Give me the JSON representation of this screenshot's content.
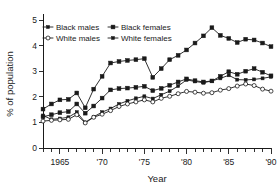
{
  "chart_data": {
    "type": "line",
    "title": "",
    "xlabel": "Year",
    "ylabel": "% of population",
    "xlim": [
      1963,
      1990
    ],
    "ylim": [
      0,
      5
    ],
    "yticks": [
      0,
      1,
      2,
      3,
      4,
      5
    ],
    "ytick_labels": [
      "0",
      "1",
      "2",
      "3",
      "4",
      "5"
    ],
    "xticks": [
      1965,
      1970,
      1975,
      1980,
      1985,
      1990
    ],
    "xtick_labels": [
      "1965",
      "'70",
      "'75",
      "'80",
      "'85",
      "'90"
    ],
    "x_minor_tick_interval": 1,
    "grid": false,
    "legend_position": "upper-left-inside",
    "x": [
      1963,
      1964,
      1965,
      1966,
      1967,
      1968,
      1969,
      1970,
      1971,
      1972,
      1973,
      1974,
      1975,
      1976,
      1977,
      1978,
      1979,
      1980,
      1981,
      1982,
      1983,
      1984,
      1985,
      1986,
      1987,
      1988,
      1989,
      1990
    ],
    "series": [
      {
        "name": "Black males",
        "marker": "filled-square",
        "values": [
          1.52,
          1.72,
          1.88,
          1.9,
          2.15,
          1.57,
          2.3,
          2.8,
          3.32,
          3.38,
          3.42,
          3.45,
          3.49,
          2.76,
          3.1,
          3.45,
          3.62,
          3.83,
          4.1,
          4.38,
          4.7,
          4.4,
          4.28,
          4.12,
          4.25,
          4.22,
          4.1,
          3.96
        ]
      },
      {
        "name": "Black females",
        "marker": "filled-square",
        "values": [
          1.22,
          1.3,
          1.38,
          1.42,
          1.72,
          1.36,
          1.64,
          1.95,
          2.27,
          2.32,
          2.34,
          2.37,
          2.41,
          2.24,
          2.33,
          2.45,
          2.58,
          2.7,
          2.63,
          2.58,
          2.62,
          2.8,
          2.98,
          2.88,
          3.0,
          3.1,
          2.96,
          2.82
        ]
      },
      {
        "name": "White females",
        "marker": "filled-small",
        "values": [
          1.27,
          1.12,
          1.15,
          1.2,
          1.4,
          1.0,
          1.22,
          1.4,
          1.54,
          1.72,
          1.84,
          1.94,
          2.02,
          1.93,
          2.08,
          2.22,
          2.42,
          2.66,
          2.6,
          2.55,
          2.62,
          2.72,
          2.84,
          2.67,
          2.66,
          2.68,
          2.72,
          2.78
        ]
      },
      {
        "name": "White males",
        "marker": "open-circle",
        "values": [
          1.05,
          1.08,
          1.1,
          1.12,
          1.3,
          0.98,
          1.2,
          1.32,
          1.46,
          1.62,
          1.72,
          1.8,
          1.88,
          1.8,
          1.94,
          2.02,
          2.12,
          2.21,
          2.18,
          2.14,
          2.16,
          2.26,
          2.32,
          2.42,
          2.5,
          2.44,
          2.3,
          2.22
        ]
      }
    ],
    "legend_entries": [
      {
        "label": "Black males",
        "marker": "filled-small"
      },
      {
        "label": "Black females",
        "marker": "filled-square"
      },
      {
        "label": "White males",
        "marker": "open-circle"
      },
      {
        "label": "White females",
        "marker": "filled-small"
      }
    ]
  },
  "colors": {
    "ink": "#1a1a1a",
    "background": "#ffffff"
  }
}
